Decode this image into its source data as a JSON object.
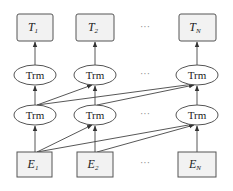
{
  "diagram": {
    "type": "transformer-stack",
    "outputs": [
      {
        "base": "T",
        "sub": "1"
      },
      {
        "base": "T",
        "sub": "2"
      },
      {
        "base": "T",
        "sub": "N"
      }
    ],
    "layer_upper": [
      {
        "label": "Trm"
      },
      {
        "label": "Trm"
      },
      {
        "label": "Trm"
      }
    ],
    "layer_lower": [
      {
        "label": "Trm"
      },
      {
        "label": "Trm"
      },
      {
        "label": "Trm"
      }
    ],
    "inputs": [
      {
        "base": "E",
        "sub": "1"
      },
      {
        "base": "E",
        "sub": "2"
      },
      {
        "base": "E",
        "sub": "N"
      }
    ],
    "ellipsis": "···",
    "colors": {
      "box_fill": "#f2f2f2",
      "stroke": "#555555",
      "text": "#222222"
    }
  }
}
